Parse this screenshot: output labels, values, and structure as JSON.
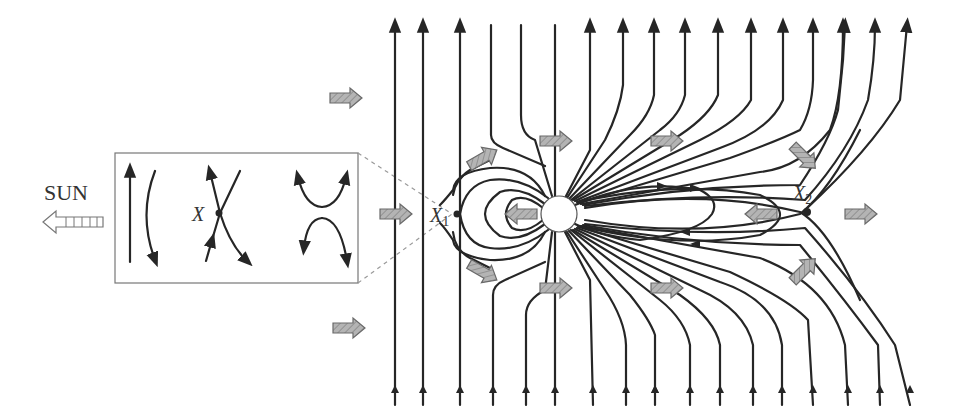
{
  "figure": {
    "sun_label": "SUN",
    "inset": {
      "x_point_label": "X",
      "panels": [
        "antiparallel field lines",
        "X-point crossing",
        "reconnected field lines"
      ]
    },
    "labels": {
      "x1_main": "X",
      "x1_sub": "1",
      "x2_main": "X",
      "x2_sub": "2"
    },
    "colors": {
      "line": "#262626",
      "flow_arrow_fill": "#a8a8a8",
      "flow_arrow_stroke": "#6a6a6a",
      "dashed": "#9a9a9a",
      "background": "#ffffff"
    },
    "flow_arrows": [
      {
        "x": 330,
        "y": 98,
        "angle": 0
      },
      {
        "x": 333,
        "y": 328,
        "angle": 0
      },
      {
        "x": 380,
        "y": 214,
        "angle": 0
      },
      {
        "x": 467,
        "y": 158,
        "angle": -30
      },
      {
        "x": 467,
        "y": 272,
        "angle": 30
      },
      {
        "x": 540,
        "y": 141,
        "angle": 0
      },
      {
        "x": 540,
        "y": 288,
        "angle": 0
      },
      {
        "x": 651,
        "y": 141,
        "angle": 0
      },
      {
        "x": 651,
        "y": 288,
        "angle": 0
      },
      {
        "x": 505,
        "y": 214,
        "angle": 180
      },
      {
        "x": 745,
        "y": 214,
        "angle": 180
      },
      {
        "x": 788,
        "y": 157,
        "angle": 45
      },
      {
        "x": 788,
        "y": 270,
        "angle": -45
      },
      {
        "x": 845,
        "y": 214,
        "angle": 0
      }
    ]
  }
}
